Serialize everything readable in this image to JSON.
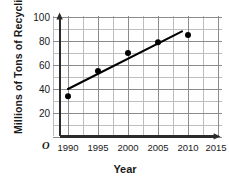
{
  "chart_data": {
    "type": "scatter",
    "title": "",
    "xlabel": "Year",
    "ylabel": "Millions of Tons of Recycling",
    "origin_label": "O",
    "x": [
      1990,
      1995,
      2000,
      2005,
      2010
    ],
    "values": [
      34,
      55,
      70,
      79,
      85
    ],
    "points": [
      {
        "x": 1990,
        "y": 34
      },
      {
        "x": 1995,
        "y": 55
      },
      {
        "x": 2000,
        "y": 70
      },
      {
        "x": 2005,
        "y": 79
      },
      {
        "x": 2010,
        "y": 85
      }
    ],
    "trend_line": {
      "x_start": 1990,
      "y_start": 40,
      "x_end": 2009,
      "y_end": 88
    },
    "xlim": [
      1987,
      2016
    ],
    "ylim": [
      0,
      100
    ],
    "xticks": [
      1990,
      1995,
      2000,
      2005,
      2010,
      2015
    ],
    "xtick_labels": [
      "1990",
      "1995",
      "2000",
      "2005",
      "2010",
      "2015"
    ],
    "yticks": [
      20,
      40,
      60,
      80,
      100
    ],
    "ytick_labels": [
      "20",
      "40",
      "60",
      "80",
      "100"
    ],
    "minor_y_step": 10,
    "grid": true,
    "legend": null,
    "series_color": "#000000",
    "grid_color": "#9a9a9a",
    "axis_color": "#2b2b2b"
  }
}
